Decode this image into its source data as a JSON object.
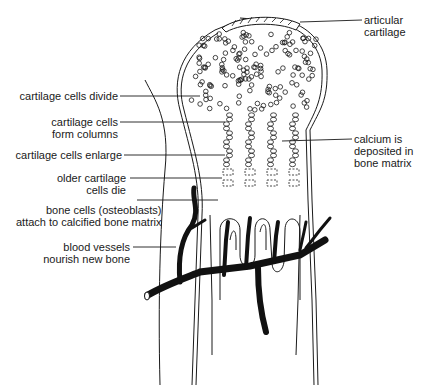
{
  "diagram": {
    "title": "",
    "colors": {
      "ink": "#1a1a1a",
      "background": "#ffffff"
    },
    "labels": {
      "articular_cartilage": [
        "articular",
        "cartilage"
      ],
      "cells_divide": [
        "cartilage cells divide"
      ],
      "form_columns": [
        "cartilage cells",
        "form columns"
      ],
      "cells_enlarge": [
        "cartilage cells enlarge"
      ],
      "cells_die": [
        "older cartilage",
        "cells die"
      ],
      "osteoblasts": [
        "bone cells (osteoblasts)",
        "attach to calcified bone matrix"
      ],
      "blood_vessels": [
        "blood vessels",
        "nourish new bone"
      ],
      "calcium": [
        "calcium is",
        "deposited in",
        "bone matrix"
      ]
    }
  }
}
